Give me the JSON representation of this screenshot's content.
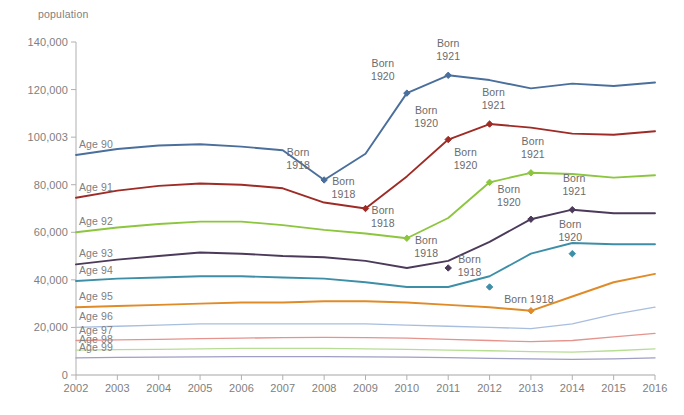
{
  "chart_data": {
    "type": "line",
    "title": "",
    "ylabel": "population",
    "xlabel": "",
    "grid": false,
    "legend_position": "inline-left-labels",
    "ylim": [
      0,
      140000
    ],
    "ytick_labels": [
      "140,000",
      "120,000",
      "100,003",
      "80,000",
      "60,000",
      "40,000",
      "20,000",
      "0"
    ],
    "yticks": [
      140000,
      120000,
      100000,
      80000,
      60000,
      40000,
      20000,
      0
    ],
    "categories": [
      2002,
      2003,
      2004,
      2005,
      2006,
      2007,
      2008,
      2009,
      2010,
      2011,
      2012,
      2013,
      2014,
      2015,
      2016
    ],
    "x": [
      "2002",
      "2003",
      "2004",
      "2005",
      "2006",
      "2007",
      "2008",
      "2009",
      "2010",
      "2011",
      "2012",
      "2013",
      "2014",
      "2015",
      "2016"
    ],
    "series": [
      {
        "name": "Age 90",
        "color": "#4a6f9c",
        "values": [
          92500,
          95000,
          96500,
          97000,
          96000,
          94500,
          82000,
          93000,
          118500,
          126000,
          124000,
          120500,
          122500,
          121500,
          123000
        ]
      },
      {
        "name": "Age 91",
        "color": "#9e2b25",
        "values": [
          74500,
          77500,
          79500,
          80500,
          80000,
          78500,
          72500,
          70000,
          83500,
          99000,
          105500,
          104000,
          101500,
          101000,
          102500
        ]
      },
      {
        "name": "Age 92",
        "color": "#8cc63e",
        "values": [
          60000,
          62000,
          63500,
          64500,
          64500,
          63000,
          61000,
          59500,
          57500,
          66000,
          81000,
          85000,
          84500,
          83000,
          84000
        ]
      },
      {
        "name": "Age 93",
        "color": "#4b3a5a",
        "values": [
          46500,
          48500,
          50000,
          51500,
          51000,
          50000,
          49500,
          48000,
          45000,
          48000,
          56000,
          65500,
          69500,
          68000,
          68000
        ]
      },
      {
        "name": "Age 94",
        "color": "#3d8fa8",
        "values": [
          39500,
          40500,
          41000,
          41500,
          41500,
          41000,
          40500,
          39000,
          37000,
          37000,
          41500,
          51000,
          55500,
          55000,
          55000
        ]
      },
      {
        "name": "Age 95",
        "color": "#e08b28",
        "values": [
          28500,
          29000,
          29500,
          30000,
          30500,
          30500,
          31000,
          31000,
          30500,
          29500,
          28500,
          27000,
          33000,
          39000,
          42500
        ]
      },
      {
        "name": "Age 96",
        "color": "#a8bede",
        "values": [
          20000,
          20500,
          21000,
          21500,
          21500,
          21500,
          21500,
          21500,
          21000,
          20500,
          20000,
          19500,
          21500,
          25500,
          28500
        ]
      },
      {
        "name": "Age 97",
        "color": "#e5938c",
        "values": [
          14500,
          14800,
          15000,
          15300,
          15500,
          15700,
          15800,
          15700,
          15500,
          15000,
          14500,
          14000,
          14500,
          16000,
          17500
        ]
      },
      {
        "name": "Age 98",
        "color": "#b7dd94",
        "values": [
          10500,
          10700,
          10800,
          11000,
          11200,
          11200,
          11200,
          11000,
          10800,
          10500,
          10200,
          9800,
          9600,
          10200,
          11000
        ]
      },
      {
        "name": "Age 99",
        "color": "#9f9ec4",
        "values": [
          7200,
          7400,
          7500,
          7600,
          7700,
          7700,
          7700,
          7600,
          7500,
          7300,
          7000,
          6800,
          6600,
          6800,
          7200
        ]
      }
    ],
    "annotations": [
      {
        "text_line1": "Born",
        "text_line2": "1918",
        "series": "Age 90",
        "x": 2008,
        "y": 82000,
        "marker": true
      },
      {
        "text_line1": "Born",
        "text_line2": "1920",
        "series": "Age 90",
        "x": 2010,
        "y": 118500,
        "marker": true
      },
      {
        "text_line1": "Born",
        "text_line2": "1921",
        "series": "Age 90",
        "x": 2011,
        "y": 126000,
        "marker": true
      },
      {
        "text_line1": "Born",
        "text_line2": "1918",
        "series": "Age 91",
        "x": 2009,
        "y": 70000,
        "marker": true
      },
      {
        "text_line1": "Born",
        "text_line2": "1920",
        "series": "Age 91",
        "x": 2011,
        "y": 99000,
        "marker": true
      },
      {
        "text_line1": "Born",
        "text_line2": "1921",
        "series": "Age 91",
        "x": 2012,
        "y": 105500,
        "marker": true
      },
      {
        "text_line1": "Born",
        "text_line2": "1918",
        "series": "Age 92",
        "x": 2010,
        "y": 57500,
        "marker": true
      },
      {
        "text_line1": "Born",
        "text_line2": "1920",
        "series": "Age 92",
        "x": 2012,
        "y": 81000,
        "marker": true
      },
      {
        "text_line1": "Born",
        "text_line2": "1921",
        "series": "Age 92",
        "x": 2013,
        "y": 85000,
        "marker": true
      },
      {
        "text_line1": "Born",
        "text_line2": "1918",
        "series": "Age 93",
        "x": 2011,
        "y": 45000,
        "marker": true
      },
      {
        "text_line1": "Born",
        "text_line2": "1920",
        "series": "Age 93",
        "x": 2013,
        "y": 65500,
        "marker": true
      },
      {
        "text_line1": "Born",
        "text_line2": "1921",
        "series": "Age 93",
        "x": 2014,
        "y": 69500,
        "marker": true
      },
      {
        "text_line1": "Born",
        "text_line2": "1918",
        "series": "Age 94",
        "x": 2012,
        "y": 37000,
        "marker": true
      },
      {
        "text_line1": "Born",
        "text_line2": "1920",
        "series": "Age 94",
        "x": 2014,
        "y": 51000,
        "marker": true
      },
      {
        "text_line1": "Born 1918",
        "text_line2": "",
        "series": "Age 95",
        "x": 2013,
        "y": 27000,
        "marker": true
      }
    ]
  }
}
